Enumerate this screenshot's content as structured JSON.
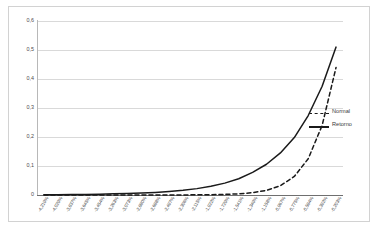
{
  "chart_data": {
    "type": "line",
    "title": "",
    "xlabel": "",
    "ylabel": "",
    "ylim": [
      0,
      0.6
    ],
    "grid": true,
    "legend_position": "right-middle",
    "ytick_labels": [
      "0,6",
      "0,5",
      "0,4",
      "0,3",
      "0,2",
      "0,1",
      "0"
    ],
    "ytick_values": [
      0.6,
      0.5,
      0.4,
      0.3,
      0.2,
      0.1,
      0
    ],
    "categories": [
      "-4,219%",
      "-4,029%",
      "-3,837%",
      "-3,645%",
      "-3,454%",
      "-3,263%",
      "-3,073%",
      "-2,880%",
      "-2,688%",
      "-2,497%",
      "-2,306%",
      "-2,115%",
      "-1,922%",
      "-1,729%",
      "-1,541%",
      "-1,349%",
      "-1,158%",
      "-0,967%",
      "-0,775%",
      "-0,584%",
      "-0,392%",
      "-0,203%"
    ],
    "x_numeric": [
      -4.219,
      -4.029,
      -3.837,
      -3.645,
      -3.454,
      -3.263,
      -3.073,
      -2.88,
      -2.688,
      -2.497,
      -2.306,
      -2.115,
      -1.922,
      -1.729,
      -1.541,
      -1.349,
      -1.158,
      -0.967,
      -0.775,
      -0.584,
      -0.392,
      -0.203
    ],
    "series": [
      {
        "name": "Normal",
        "style": "dashed",
        "color": "#1a1a1a",
        "values": [
          0.0,
          0.0,
          0.0,
          0.0,
          0.0,
          0.0,
          0.0,
          0.0,
          0.0,
          0.0,
          0.0,
          0.001,
          0.001,
          0.002,
          0.004,
          0.008,
          0.016,
          0.032,
          0.064,
          0.125,
          0.24,
          0.44
        ]
      },
      {
        "name": "Retorno",
        "style": "solid",
        "color": "#1a1a1a",
        "values": [
          0.001,
          0.001,
          0.002,
          0.002,
          0.003,
          0.004,
          0.005,
          0.007,
          0.009,
          0.012,
          0.016,
          0.022,
          0.03,
          0.041,
          0.056,
          0.078,
          0.106,
          0.145,
          0.198,
          0.274,
          0.375,
          0.51
        ]
      }
    ]
  },
  "legend": {
    "entries": [
      {
        "label": "Normal",
        "symbol": "dashed-line-swatch"
      },
      {
        "label": "Retorno",
        "symbol": "solid-line-swatch"
      }
    ]
  }
}
